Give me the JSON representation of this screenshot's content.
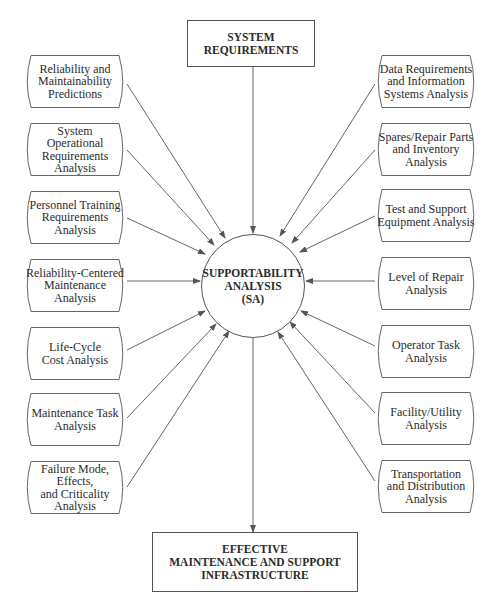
{
  "top_box": {
    "lines": [
      "SYSTEM",
      "REQUIREMENTS"
    ]
  },
  "center": {
    "lines": [
      "SUPPORTABILITY",
      "ANALYSIS",
      "(SA)"
    ]
  },
  "bottom_box": {
    "lines": [
      "EFFECTIVE",
      "MAINTENANCE AND SUPPORT",
      "INFRASTRUCTURE"
    ]
  },
  "left_items": [
    {
      "lines": [
        "Reliability and",
        "Maintainability",
        "Predictions"
      ]
    },
    {
      "lines": [
        "System",
        "Operational",
        "Requirements",
        "Analysis"
      ]
    },
    {
      "lines": [
        "Personnel Training",
        "Requirements",
        "Analysis"
      ]
    },
    {
      "lines": [
        "Reliability-Centered",
        "Maintenance",
        "Analysis"
      ]
    },
    {
      "lines": [
        "Life-Cycle",
        "Cost Analysis"
      ]
    },
    {
      "lines": [
        "Maintenance Task",
        "Analysis"
      ]
    },
    {
      "lines": [
        "Failure Mode, Effects,",
        "and Criticality",
        "Analysis"
      ]
    }
  ],
  "right_items": [
    {
      "lines": [
        "Data Requirements",
        "and Information",
        "Systems Analysis"
      ]
    },
    {
      "lines": [
        "Spares/Repair Parts",
        "and Inventory",
        "Analysis"
      ]
    },
    {
      "lines": [
        "Test and Support",
        "Equipment Analysis"
      ]
    },
    {
      "lines": [
        "Level of Repair",
        "Analysis"
      ]
    },
    {
      "lines": [
        "Operator Task",
        "Analysis"
      ]
    },
    {
      "lines": [
        "Facility/Utility",
        "Analysis"
      ]
    },
    {
      "lines": [
        "Transportation",
        "and Distribution",
        "Analysis"
      ]
    }
  ],
  "colors": {
    "line": "#555555",
    "text": "#2b2b2b",
    "background": "#ffffff"
  }
}
